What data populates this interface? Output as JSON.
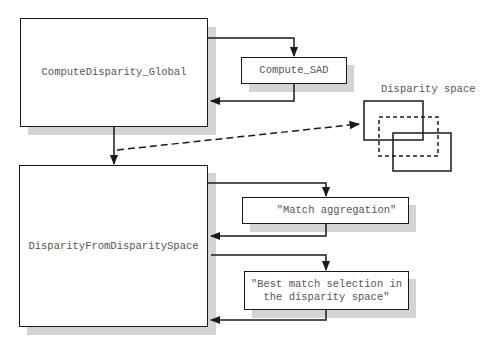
{
  "diagram": {
    "boxes": {
      "compute_disparity_global": "ComputeDisparity_Global",
      "compute_sad": "Compute_SAD",
      "disparity_from_disparity_space": "DisparityFromDisparitySpace",
      "match_aggregation": "\"Match aggregation\"",
      "best_match_line1": "\"Best match selection in",
      "best_match_line2": "the disparity space\""
    },
    "disparity_space_label": "Disparity space",
    "colors": {
      "stroke": "#1a1a1a",
      "shadow": "#d4d4d4",
      "text": "#555555"
    }
  }
}
